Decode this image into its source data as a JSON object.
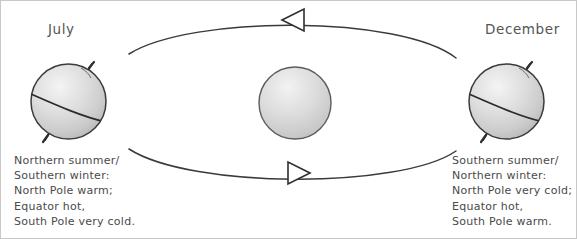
{
  "diagram": {
    "title_labels": {
      "left": "July",
      "right": "December"
    },
    "bodies": {
      "sun": {
        "name": "Sun",
        "cx": 294,
        "cy": 102,
        "r": 36
      },
      "earth_july": {
        "name": "Earth in July",
        "cx": 67.5,
        "cy": 100.5,
        "r": 37.5
      },
      "earth_december": {
        "name": "Earth in December",
        "cx": 505.5,
        "cy": 100.5,
        "r": 37.5
      }
    },
    "orbit": {
      "left_x": 128,
      "right_x": 455,
      "top_arrow_direction": "left",
      "bottom_arrow_direction": "right"
    },
    "captions": {
      "left": [
        "Northern summer/",
        "Southern winter:",
        "North Pole warm;",
        "Equator hot,",
        "South Pole very cold."
      ],
      "right": [
        "Southern summer/",
        "Northern winter:",
        "North Pole very cold;",
        "Equator hot,",
        "South Pole warm."
      ]
    },
    "colors": {
      "outline": "#3a3a3a",
      "sphere_light": "#f0f0f0",
      "sphere_mid": "#d2d2d2",
      "sphere_dark": "#9a9a9a",
      "text": "#4a4a4a",
      "label": "#545454",
      "background": "#ffffff"
    }
  }
}
